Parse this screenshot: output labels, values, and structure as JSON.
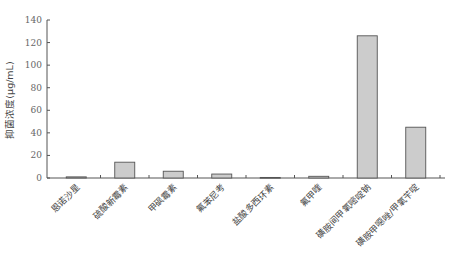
{
  "chart_data": {
    "type": "bar",
    "title": "",
    "xlabel": "",
    "ylabel": "抑菌浓度(μg/mL)",
    "ylim": [
      0,
      140
    ],
    "yticks": [
      0,
      20,
      40,
      60,
      80,
      100,
      120,
      140
    ],
    "grid": false,
    "legend": null,
    "categories": [
      "恩诺沙星",
      "硫酸新霉素",
      "甲砜霉素",
      "氟苯尼考",
      "盐酸多西环素",
      "氟甲喹",
      "磺胺间甲氧嘧啶钠",
      "磺胺甲噁唑/甲氧苄啶"
    ],
    "values": [
      1,
      14,
      6,
      3.5,
      0.5,
      1.5,
      126,
      45
    ],
    "bar_color": "#cccccc",
    "bar_edge_color": "#555555"
  }
}
